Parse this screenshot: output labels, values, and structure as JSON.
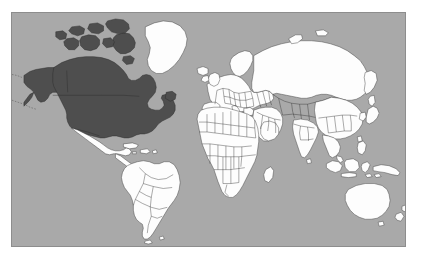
{
  "figure": {
    "kind": "world-map",
    "projection": "equirectangular",
    "frame": {
      "border_color": "#8d8d8d",
      "background_color": "#ffffff"
    }
  },
  "legend": {
    "ocean_color": "#a9a9a9",
    "land_color": "#fdfdfd",
    "highlight_color": "#4e4e4e",
    "border_color": "#2a2a2a",
    "highlight_label": "Highlighted region",
    "unhighlighted_label": "Other countries"
  },
  "map_data": {
    "type": "choropleth",
    "highlighted_regions": [
      "United States of America",
      "Canada",
      "Alaska"
    ],
    "highlighted_continent": "North America",
    "unhighlighted_regions": [
      "Greenland",
      "Iceland",
      "Mexico",
      "Central America",
      "Caribbean",
      "South America",
      "Europe",
      "Africa",
      "Russia",
      "Middle East",
      "India",
      "China",
      "Japan",
      "Southeast Asia",
      "Indonesia",
      "Australia",
      "New Zealand"
    ],
    "labels": [],
    "graticule": false,
    "country_borders": true
  }
}
